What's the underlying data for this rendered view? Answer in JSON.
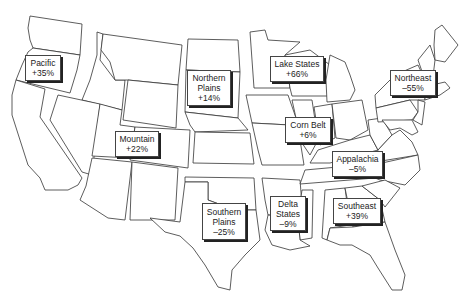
{
  "map": {
    "type": "us-farm-production-regions",
    "regions": [
      {
        "id": "pacific",
        "name": "Pacific",
        "lines": [
          "Pacific"
        ],
        "value": "+35%",
        "box": [
          25,
          55,
          36,
          26
        ]
      },
      {
        "id": "northern-plains",
        "name": "Northern Plains",
        "lines": [
          "Northern",
          "Plains"
        ],
        "value": "+14%",
        "box": [
          187,
          70,
          44,
          36
        ]
      },
      {
        "id": "lake-states",
        "name": "Lake States",
        "lines": [
          "Lake States"
        ],
        "value": "+66%",
        "box": [
          270,
          56,
          54,
          26
        ]
      },
      {
        "id": "northeast",
        "name": "Northeast",
        "lines": [
          "Northeast"
        ],
        "value": "–55%",
        "box": [
          390,
          70,
          46,
          26
        ]
      },
      {
        "id": "corn-belt",
        "name": "Corn Belt",
        "lines": [
          "Corn Belt"
        ],
        "value": "+6%",
        "box": [
          285,
          117,
          46,
          26
        ]
      },
      {
        "id": "mountain",
        "name": "Mountain",
        "lines": [
          "Mountain"
        ],
        "value": "+22%",
        "box": [
          115,
          131,
          44,
          26
        ]
      },
      {
        "id": "appalachia",
        "name": "Appalachia",
        "lines": [
          "Appalachia"
        ],
        "value": "–5%",
        "box": [
          332,
          151,
          51,
          26
        ]
      },
      {
        "id": "southern-plains",
        "name": "Southern Plains",
        "lines": [
          "Southern",
          "Plains"
        ],
        "value": "–25%",
        "box": [
          202,
          203,
          44,
          37
        ]
      },
      {
        "id": "delta-states",
        "name": "Delta States",
        "lines": [
          "Delta",
          "States"
        ],
        "value": "–9%",
        "box": [
          270,
          196,
          36,
          35
        ]
      },
      {
        "id": "southeast",
        "name": "Southeast",
        "lines": [
          "Southeast"
        ],
        "value": "+39%",
        "box": [
          333,
          198,
          48,
          26
        ]
      }
    ]
  }
}
